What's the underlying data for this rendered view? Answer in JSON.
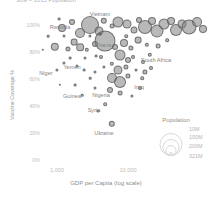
{
  "chart_data": {
    "type": "scatter",
    "title": "",
    "subtitle": "Size = 2015 Population",
    "xlabel": "GDP per Capita (log scale)",
    "ylabel": "Vaccine Coverage %",
    "grid": false,
    "legend_position": "bottom-right",
    "xscale": "log",
    "xticks": [
      "1,000",
      "10,000"
    ],
    "yticks": [
      "100%",
      "80%",
      "60%",
      "40%",
      "20%",
      "0%"
    ],
    "ylim": [
      0,
      110
    ],
    "size_legend": {
      "title": "Population",
      "entries": [
        "10M",
        "100M",
        "200M",
        "321M"
      ]
    },
    "labeled_points": [
      {
        "name": "Vietnam",
        "gdp": 2100,
        "coverage": 97,
        "population": 93
      },
      {
        "name": "Rwanda",
        "gdp": 700,
        "coverage": 98,
        "population": 11
      },
      {
        "name": "Ghana",
        "gdp": 1700,
        "coverage": 88,
        "population": 28
      },
      {
        "name": "South Africa",
        "gdp": 6000,
        "coverage": 74,
        "population": 55
      },
      {
        "name": "Niger",
        "gdp": 400,
        "coverage": 65,
        "population": 20
      },
      {
        "name": "Yemen",
        "gdp": 1200,
        "coverage": 69,
        "population": 26
      },
      {
        "name": "Guinea",
        "gdp": 600,
        "coverage": 51,
        "population": 12
      },
      {
        "name": "Nigeria",
        "gdp": 2600,
        "coverage": 49,
        "population": 181
      },
      {
        "name": "Iraq",
        "gdp": 4800,
        "coverage": 58,
        "population": 36
      },
      {
        "name": "Syria",
        "gdp": 1800,
        "coverage": 42,
        "population": 18
      },
      {
        "name": "Ukraine",
        "gdp": 2200,
        "coverage": 23,
        "population": 45
      }
    ],
    "series": [
      {
        "name": "Countries",
        "points": [
          {
            "x": 2100,
            "y": 97,
            "r": 9.0
          },
          {
            "x": 700,
            "y": 98,
            "r": 1.6
          },
          {
            "x": 1700,
            "y": 88,
            "r": 10.5
          },
          {
            "x": 6000,
            "y": 74,
            "r": 4.0
          },
          {
            "x": 400,
            "y": 65,
            "r": 2.4
          },
          {
            "x": 1200,
            "y": 69,
            "r": 2.0
          },
          {
            "x": 600,
            "y": 51,
            "r": 1.8
          },
          {
            "x": 2600,
            "y": 49,
            "r": 7.5
          },
          {
            "x": 4800,
            "y": 58,
            "r": 2.6
          },
          {
            "x": 1800,
            "y": 42,
            "r": 2.0
          },
          {
            "x": 2200,
            "y": 23,
            "r": 3.2
          }
        ]
      }
    ],
    "bubbles": [
      {
        "cx": 62,
        "cy": 28,
        "r": 4.0
      },
      {
        "cx": 72,
        "cy": 22,
        "r": 3.0
      },
      {
        "cx": 80,
        "cy": 33,
        "r": 5.0
      },
      {
        "cx": 90,
        "cy": 25,
        "r": 9.0
      },
      {
        "cx": 99,
        "cy": 31,
        "r": 4.5
      },
      {
        "cx": 104,
        "cy": 21,
        "r": 3.2
      },
      {
        "cx": 112,
        "cy": 26,
        "r": 2.4
      },
      {
        "cx": 118,
        "cy": 22,
        "r": 5.5
      },
      {
        "cx": 127,
        "cy": 24,
        "r": 4.5
      },
      {
        "cx": 134,
        "cy": 30,
        "r": 3.5
      },
      {
        "cx": 139,
        "cy": 20,
        "r": 3.0
      },
      {
        "cx": 145,
        "cy": 27,
        "r": 7.0
      },
      {
        "cx": 152,
        "cy": 21,
        "r": 4.0
      },
      {
        "cx": 157,
        "cy": 31,
        "r": 6.5
      },
      {
        "cx": 164,
        "cy": 24,
        "r": 5.5
      },
      {
        "cx": 171,
        "cy": 21,
        "r": 4.0
      },
      {
        "cx": 176,
        "cy": 30,
        "r": 6.0
      },
      {
        "cx": 182,
        "cy": 24,
        "r": 4.5
      },
      {
        "cx": 189,
        "cy": 27,
        "r": 7.5
      },
      {
        "cx": 197,
        "cy": 22,
        "r": 5.0
      },
      {
        "cx": 203,
        "cy": 29,
        "r": 4.0
      },
      {
        "cx": 59,
        "cy": 19,
        "r": 1.4
      },
      {
        "cx": 48,
        "cy": 36,
        "r": 1.3
      },
      {
        "cx": 55,
        "cy": 47,
        "r": 4.2
      },
      {
        "cx": 68,
        "cy": 49,
        "r": 2.6
      },
      {
        "cx": 74,
        "cy": 42,
        "r": 3.4
      },
      {
        "cx": 80,
        "cy": 47,
        "r": 3.8
      },
      {
        "cx": 87,
        "cy": 50,
        "r": 2.2
      },
      {
        "cx": 95,
        "cy": 44,
        "r": 3.0
      },
      {
        "cx": 105,
        "cy": 41,
        "r": 10.5
      },
      {
        "cx": 115,
        "cy": 47,
        "r": 3.0
      },
      {
        "cx": 124,
        "cy": 43,
        "r": 4.0
      },
      {
        "cx": 131,
        "cy": 48,
        "r": 2.6
      },
      {
        "cx": 138,
        "cy": 40,
        "r": 3.4
      },
      {
        "cx": 147,
        "cy": 45,
        "r": 2.2
      },
      {
        "cx": 43,
        "cy": 50,
        "r": 1.2
      },
      {
        "cx": 64,
        "cy": 36,
        "r": 1.5
      },
      {
        "cx": 90,
        "cy": 36,
        "r": 1.6
      },
      {
        "cx": 100,
        "cy": 34,
        "r": 1.4
      },
      {
        "cx": 126,
        "cy": 36,
        "r": 1.8
      },
      {
        "cx": 85,
        "cy": 58,
        "r": 1.5
      },
      {
        "cx": 96,
        "cy": 56,
        "r": 1.4
      },
      {
        "cx": 101,
        "cy": 57,
        "r": 2.0
      },
      {
        "cx": 120,
        "cy": 55,
        "r": 5.5
      },
      {
        "cx": 128,
        "cy": 60,
        "r": 3.0
      },
      {
        "cx": 133,
        "cy": 57,
        "r": 2.0
      },
      {
        "cx": 64,
        "cy": 63,
        "r": 1.6
      },
      {
        "cx": 104,
        "cy": 67,
        "r": 1.6
      },
      {
        "cx": 112,
        "cy": 64,
        "r": 2.2
      },
      {
        "cx": 118,
        "cy": 70,
        "r": 4.5
      },
      {
        "cx": 126,
        "cy": 67,
        "r": 2.6
      },
      {
        "cx": 95,
        "cy": 72,
        "r": 1.5
      },
      {
        "cx": 90,
        "cy": 78,
        "r": 1.3
      },
      {
        "cx": 112,
        "cy": 78,
        "r": 5.0
      },
      {
        "cx": 120,
        "cy": 82,
        "r": 6.0
      },
      {
        "cx": 128,
        "cy": 76,
        "r": 2.6
      },
      {
        "cx": 142,
        "cy": 78,
        "r": 1.8
      },
      {
        "cx": 75,
        "cy": 85,
        "r": 1.4
      },
      {
        "cx": 95,
        "cy": 88,
        "r": 1.5
      },
      {
        "cx": 110,
        "cy": 90,
        "r": 3.0
      },
      {
        "cx": 120,
        "cy": 93,
        "r": 2.4
      },
      {
        "cx": 145,
        "cy": 72,
        "r": 2.6
      },
      {
        "cx": 151,
        "cy": 68,
        "r": 2.0
      },
      {
        "cx": 140,
        "cy": 88,
        "r": 2.0
      },
      {
        "cx": 105,
        "cy": 104,
        "r": 1.8
      },
      {
        "cx": 98,
        "cy": 111,
        "r": 1.4
      },
      {
        "cx": 112,
        "cy": 124,
        "r": 3.2
      },
      {
        "cx": 82,
        "cy": 95,
        "r": 1.3
      },
      {
        "cx": 70,
        "cy": 58,
        "r": 1.4
      },
      {
        "cx": 57,
        "cy": 70,
        "r": 1.6
      },
      {
        "cx": 77,
        "cy": 66,
        "r": 1.5
      },
      {
        "cx": 84,
        "cy": 70,
        "r": 1.4
      },
      {
        "cx": 60,
        "cy": 85,
        "r": 1.2
      },
      {
        "cx": 132,
        "cy": 96,
        "r": 1.6
      },
      {
        "cx": 150,
        "cy": 55,
        "r": 2.2
      },
      {
        "cx": 158,
        "cy": 46,
        "r": 2.4
      },
      {
        "cx": 167,
        "cy": 40,
        "r": 1.8
      },
      {
        "cx": 143,
        "cy": 62,
        "r": 2.0
      },
      {
        "cx": 136,
        "cy": 70,
        "r": 1.5
      }
    ]
  },
  "axes": {
    "ytick_positions": [
      {
        "label": "100%",
        "top": 25
      },
      {
        "label": "80%",
        "top": 52
      },
      {
        "label": "60%",
        "top": 79
      },
      {
        "label": "40%",
        "top": 106
      },
      {
        "label": "20%",
        "top": 133
      },
      {
        "label": "0%",
        "top": 160
      }
    ],
    "xtick_positions": [
      {
        "label": "1,000",
        "left": 57
      },
      {
        "label": "10,000",
        "left": 128
      }
    ]
  },
  "annotations": [
    {
      "text": "Vietnam",
      "left": 100,
      "top": 14
    },
    {
      "text": "Rwanda",
      "left": 60,
      "top": 27
    },
    {
      "text": "Ghana",
      "left": 103,
      "top": 45
    },
    {
      "text": "South Africa",
      "left": 156,
      "top": 60
    },
    {
      "text": "Niger",
      "left": 46,
      "top": 73
    },
    {
      "text": "Yemen",
      "left": 72,
      "top": 67
    },
    {
      "text": "Guinea",
      "left": 72,
      "top": 96
    },
    {
      "text": "Nigeria",
      "left": 101,
      "top": 95
    },
    {
      "text": "Iraq",
      "left": 139,
      "top": 87
    },
    {
      "text": "Syria",
      "left": 94,
      "top": 110
    },
    {
      "text": "Ukraine",
      "left": 104,
      "top": 133
    }
  ],
  "legend": {
    "title": "Population",
    "title_left": 176,
    "title_top": 117,
    "center_left": 171,
    "baseline_top": 156,
    "entries": [
      {
        "label": "10M",
        "r": 2.0,
        "label_left": 189,
        "label_top": 126
      },
      {
        "label": "100M",
        "r": 5.5,
        "label_left": 189,
        "label_top": 134
      },
      {
        "label": "200M",
        "r": 8.5,
        "label_left": 189,
        "label_top": 143
      },
      {
        "label": "321M",
        "r": 11.5,
        "label_left": 189,
        "label_top": 153
      }
    ]
  }
}
